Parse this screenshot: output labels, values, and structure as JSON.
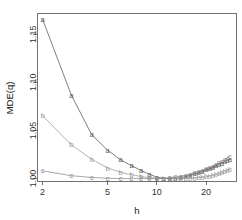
{
  "chart_data": {
    "type": "line",
    "title": "",
    "subtitle": "",
    "xlabel": "h",
    "ylabel": "MDE(q)",
    "xscale": "log",
    "yscale": "linear",
    "xlim": [
      1.85,
      30.5
    ],
    "ylim": [
      0.9975,
      1.172
    ],
    "xticks": [
      2,
      5,
      10,
      20
    ],
    "xtick_labels": [
      "2",
      "5",
      "10",
      "20"
    ],
    "yticks": [
      1.0,
      1.05,
      1.1,
      1.15
    ],
    "ytick_labels": [
      "1.00",
      "1.05",
      "1.10",
      "1.15"
    ],
    "grid": false,
    "legend": "none",
    "point_marker_style": "series-letter",
    "x": [
      2,
      3,
      4,
      5,
      6,
      7,
      8,
      9,
      10,
      11,
      12,
      13,
      14,
      15,
      16,
      17,
      18,
      19,
      20,
      21,
      22,
      23,
      24,
      25,
      26,
      27,
      28
    ],
    "series": [
      {
        "name": "a",
        "marker": "a",
        "color": "#555555",
        "values": [
          1.1655,
          1.0868,
          1.0455,
          1.0295,
          1.0195,
          1.0135,
          1.0085,
          1.0045,
          1.0015,
          1.0004,
          1.0,
          1.0003,
          1.001,
          1.0022,
          1.0035,
          1.0048,
          1.0062,
          1.0076,
          1.009,
          1.0104,
          1.0118,
          1.0132,
          1.0146,
          1.016,
          1.0174,
          1.0188,
          1.0201
        ]
      },
      {
        "name": "b",
        "marker": "b",
        "color": "#9a9a9a",
        "values": [
          1.0655,
          1.035,
          1.02,
          1.011,
          1.0065,
          1.004,
          1.0022,
          1.001,
          1.0003,
          1.0,
          0.9999,
          0.9999,
          1.0,
          1.0001,
          1.0003,
          1.0006,
          1.001,
          1.0014,
          1.0019,
          1.0025,
          1.0032,
          1.004,
          1.0049,
          1.0059,
          1.007,
          1.0082,
          1.0095
        ]
      },
      {
        "name": "c",
        "marker": "c",
        "color": "#8a8a8a",
        "values": [
          1.008,
          1.003,
          1.0012,
          1.0004,
          1.0,
          0.9999,
          0.9999,
          1.0,
          1.0002,
          1.0005,
          1.001,
          1.0017,
          1.0026,
          1.0036,
          1.0047,
          1.0059,
          1.0072,
          1.0086,
          1.01,
          1.0115,
          1.013,
          1.0146,
          1.0162,
          1.0179,
          1.0196,
          1.0213,
          1.0232
        ]
      }
    ]
  },
  "axes": {
    "x_title": "h",
    "y_title": "MDE(q)"
  }
}
